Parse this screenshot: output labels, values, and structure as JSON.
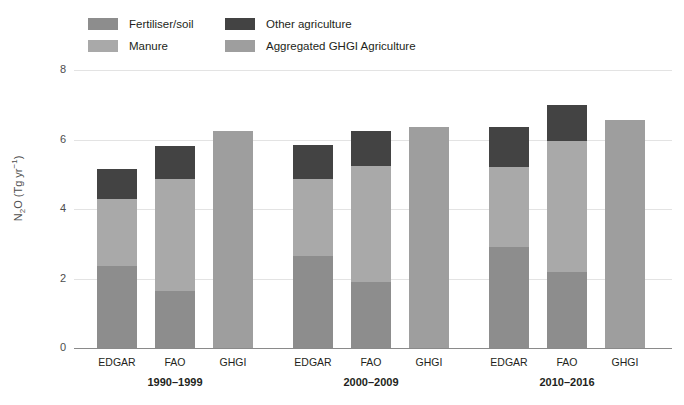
{
  "legend": {
    "items": [
      {
        "label": "Fertiliser/soil",
        "color": "#8d8d8d",
        "row": 0,
        "col": 0
      },
      {
        "label": "Manure",
        "color": "#a9a9a9",
        "row": 1,
        "col": 0
      },
      {
        "label": "Other agriculture",
        "color": "#434343",
        "row": 0,
        "col": 1
      },
      {
        "label": "Aggregated GHGI Agriculture",
        "color": "#9e9e9e",
        "row": 1,
        "col": 1
      }
    ]
  },
  "axis": {
    "ylabel_text": "N",
    "ylabel_sub": "2",
    "ylabel_mid": "O (Tg yr",
    "ylabel_sup": "−1",
    "ylabel_end": ")",
    "yticks": [
      "8",
      "6",
      "4",
      "2",
      "0"
    ],
    "ylim": [
      0,
      8
    ]
  },
  "chart_data": {
    "type": "bar",
    "subtype": "stacked-grouped",
    "title": "",
    "xlabel": "",
    "ylabel": "N2O (Tg yr-1)",
    "ylim": [
      0,
      8
    ],
    "yticks": [
      0,
      2,
      4,
      6,
      8
    ],
    "grid": true,
    "legend_position": "top-left",
    "series": [
      {
        "name": "Fertiliser/soil",
        "color": "#8d8d8d"
      },
      {
        "name": "Manure",
        "color": "#a9a9a9"
      },
      {
        "name": "Other agriculture",
        "color": "#434343"
      },
      {
        "name": "Aggregated GHGI Agriculture",
        "color": "#9e9e9e"
      }
    ],
    "groups": [
      {
        "label": "1990–1999",
        "bars": [
          {
            "label": "EDGAR",
            "total": 5.15,
            "stack": [
              {
                "series": "Fertiliser/soil",
                "value": 2.35,
                "color": "#8d8d8d"
              },
              {
                "series": "Manure",
                "value": 1.95,
                "color": "#a9a9a9"
              },
              {
                "series": "Other agriculture",
                "value": 0.85,
                "color": "#434343"
              }
            ]
          },
          {
            "label": "FAO",
            "total": 5.8,
            "stack": [
              {
                "series": "Fertiliser/soil",
                "value": 1.65,
                "color": "#8d8d8d"
              },
              {
                "series": "Manure",
                "value": 3.2,
                "color": "#a9a9a9"
              },
              {
                "series": "Other agriculture",
                "value": 0.95,
                "color": "#434343"
              }
            ]
          },
          {
            "label": "GHGI",
            "total": 6.25,
            "stack": [
              {
                "series": "Aggregated GHGI Agriculture",
                "value": 6.25,
                "color": "#9e9e9e"
              }
            ]
          }
        ]
      },
      {
        "label": "2000–2009",
        "bars": [
          {
            "label": "EDGAR",
            "total": 5.85,
            "stack": [
              {
                "series": "Fertiliser/soil",
                "value": 2.65,
                "color": "#8d8d8d"
              },
              {
                "series": "Manure",
                "value": 2.2,
                "color": "#a9a9a9"
              },
              {
                "series": "Other agriculture",
                "value": 1.0,
                "color": "#434343"
              }
            ]
          },
          {
            "label": "FAO",
            "total": 6.25,
            "stack": [
              {
                "series": "Fertiliser/soil",
                "value": 1.9,
                "color": "#8d8d8d"
              },
              {
                "series": "Manure",
                "value": 3.35,
                "color": "#a9a9a9"
              },
              {
                "series": "Other agriculture",
                "value": 1.0,
                "color": "#434343"
              }
            ]
          },
          {
            "label": "GHGI",
            "total": 6.35,
            "stack": [
              {
                "series": "Aggregated GHGI Agriculture",
                "value": 6.35,
                "color": "#9e9e9e"
              }
            ]
          }
        ]
      },
      {
        "label": "2010–2016",
        "bars": [
          {
            "label": "EDGAR",
            "total": 6.35,
            "stack": [
              {
                "series": "Fertiliser/soil",
                "value": 2.9,
                "color": "#8d8d8d"
              },
              {
                "series": "Manure",
                "value": 2.3,
                "color": "#a9a9a9"
              },
              {
                "series": "Other agriculture",
                "value": 1.15,
                "color": "#434343"
              }
            ]
          },
          {
            "label": "FAO",
            "total": 7.0,
            "stack": [
              {
                "series": "Fertiliser/soil",
                "value": 2.2,
                "color": "#8d8d8d"
              },
              {
                "series": "Manure",
                "value": 3.75,
                "color": "#a9a9a9"
              },
              {
                "series": "Other agriculture",
                "value": 1.05,
                "color": "#434343"
              }
            ]
          },
          {
            "label": "GHGI",
            "total": 6.55,
            "stack": [
              {
                "series": "Aggregated GHGI Agriculture",
                "value": 6.55,
                "color": "#9e9e9e"
              }
            ]
          }
        ]
      }
    ]
  },
  "layout": {
    "plot_left": 97,
    "plot_baseline_y": 348,
    "plot_top_y": 70,
    "bar_width": 40,
    "bar_pitch": 58,
    "group_gap": 22
  }
}
